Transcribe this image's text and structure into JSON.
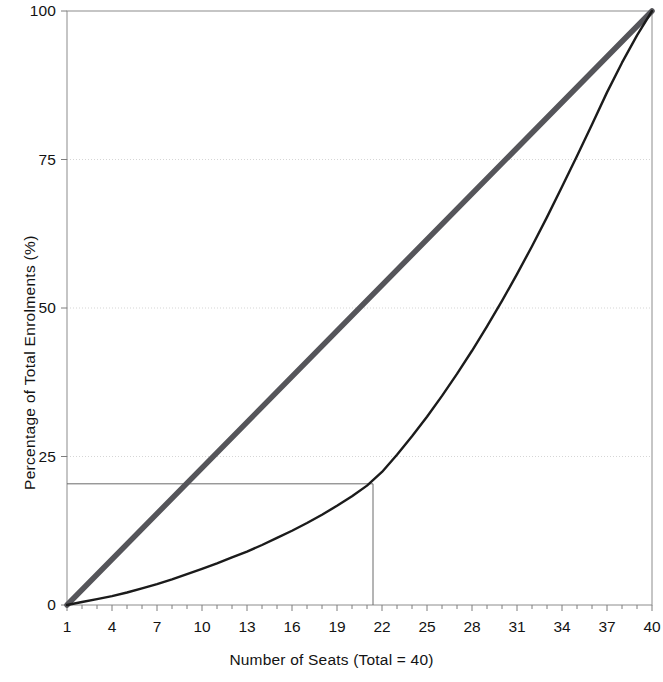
{
  "chart_data": {
    "type": "line",
    "title": "",
    "xlabel": "Number of Seats (Total = 40)",
    "ylabel": "Percentage of Total Enrolments (%)",
    "xlim": [
      1,
      40
    ],
    "ylim": [
      0,
      100
    ],
    "grid": true,
    "legend_position": "none",
    "x_ticks": [
      1,
      4,
      7,
      10,
      13,
      16,
      19,
      22,
      25,
      28,
      31,
      34,
      37,
      40
    ],
    "x_tick_labels": [
      "1",
      "4",
      "7",
      "10",
      "13",
      "16",
      "19",
      "22",
      "25",
      "28",
      "31",
      "34",
      "37",
      "40"
    ],
    "y_ticks": [
      0,
      25,
      50,
      75,
      100
    ],
    "y_tick_labels": [
      "0",
      "25",
      "50",
      "75",
      "100"
    ],
    "minor_x_ticks_every": 1,
    "series": [
      {
        "name": "Line of Equality",
        "color": "#55555a",
        "width": 5.5,
        "x": [
          1,
          40
        ],
        "values": [
          0,
          100
        ]
      },
      {
        "name": "Lorenz Curve",
        "color": "#1b1b1b",
        "width": 2.4,
        "x": [
          1,
          2,
          3,
          4,
          5,
          6,
          7,
          8,
          9,
          10,
          11,
          12,
          13,
          14,
          15,
          16,
          17,
          18,
          19,
          20,
          21,
          22,
          23,
          24,
          25,
          26,
          27,
          28,
          29,
          30,
          31,
          32,
          33,
          34,
          35,
          36,
          37,
          38,
          39,
          40
        ],
        "values": [
          0,
          0.5,
          1.0,
          1.5,
          2.1,
          2.8,
          3.5,
          4.3,
          5.2,
          6.1,
          7.0,
          8.0,
          9.0,
          10.1,
          11.3,
          12.5,
          13.8,
          15.2,
          16.7,
          18.3,
          20.1,
          22.4,
          25.3,
          28.4,
          31.7,
          35.2,
          38.9,
          42.8,
          46.9,
          51.2,
          55.7,
          60.4,
          65.3,
          70.4,
          75.6,
          80.9,
          86.3,
          91.3,
          95.9,
          100
        ]
      }
    ],
    "annotations": [
      {
        "name": "reference-lines",
        "type": "crosshair",
        "x": 21.4,
        "y": 20.4,
        "color": "#6b6b6b",
        "description": "Horizontal line from y-axis at 20.4% to curve, and vertical drop line to x-axis at seat 21.4"
      }
    ],
    "axes_color": "#7d7d7d",
    "grid_color": "#cfcfcf",
    "background": "#ffffff"
  }
}
